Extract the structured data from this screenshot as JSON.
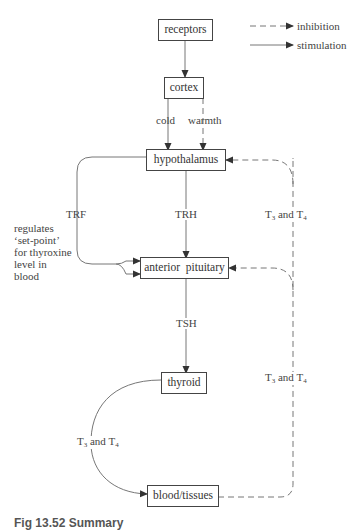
{
  "legend": {
    "inhibition": "inhibition",
    "stimulation": "stimulation"
  },
  "nodes": {
    "receptors": "receptors",
    "cortex": "cortex",
    "hypothalamus": "hypothalamus",
    "anterior_pituitary": "anterior  pituitary",
    "thyroid": "thyroid",
    "blood_tissues": "blood/tissues"
  },
  "edges": {
    "cold": "cold",
    "warmth": "warmth",
    "trf": "TRF",
    "trh": "TRH",
    "tsh": "TSH",
    "t_prefix": "T",
    "t3_sub": "3",
    "and": " and T",
    "t4_sub": "4"
  },
  "note": {
    "line1": "regulates",
    "line2": "‘set-point’",
    "line3": "for thyroxine",
    "line4": "level in",
    "line5": "blood"
  },
  "caption": "Fig 13.52   Summary"
}
